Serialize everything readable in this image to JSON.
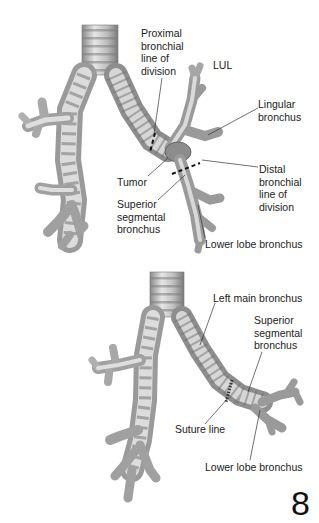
{
  "figure_number": "8",
  "panels": [
    {
      "name": "before-resection",
      "labels": [
        {
          "id": "proximal",
          "text": "Proximal\nbronchial\nline of\ndivision",
          "x": 141,
          "y": 27
        },
        {
          "id": "lul",
          "text": "LUL",
          "x": 213,
          "y": 59
        },
        {
          "id": "lingular",
          "text": "Lingular\nbronchus",
          "x": 258,
          "y": 98
        },
        {
          "id": "distal",
          "text": "Distal\nbronchial\nline of\ndivision",
          "x": 259,
          "y": 163
        },
        {
          "id": "tumor",
          "text": "Tumor",
          "x": 117,
          "y": 176
        },
        {
          "id": "superior-segmental",
          "text": "Superior\nsegmental\nbronchus",
          "x": 117,
          "y": 198
        },
        {
          "id": "lower-lobe",
          "text": "Lower lobe bronchus",
          "x": 205,
          "y": 238
        }
      ]
    },
    {
      "name": "after-anastomosis",
      "labels": [
        {
          "id": "left-main",
          "text": "Left main bronchus",
          "x": 213,
          "y": 292
        },
        {
          "id": "superior-segmental-2",
          "text": "Superior\nsegmental\nbronchus",
          "x": 254,
          "y": 314
        },
        {
          "id": "suture-line",
          "text": "Suture line",
          "x": 175,
          "y": 423
        },
        {
          "id": "lower-lobe-2",
          "text": "Lower lobe bronchus",
          "x": 205,
          "y": 461
        }
      ]
    }
  ],
  "colors": {
    "airway_light": "#d9d9d9",
    "airway_mid": "#a8a8a8",
    "airway_dark": "#6e6e6e",
    "leader": "#333333",
    "cut_line": "#111111"
  }
}
